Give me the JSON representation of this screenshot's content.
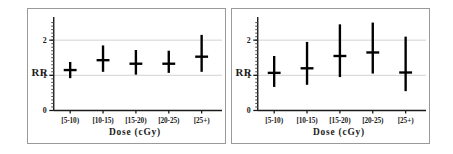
{
  "figure": {
    "background_color": "#ffffff",
    "panel_border_color": "#9a9a9a",
    "marker_color": "#000000",
    "grid_color": "#d2d2d2"
  },
  "chart_data": [
    {
      "type": "scatter",
      "panel": "left",
      "title": "",
      "xlabel": "Dose (cGy)",
      "ylabel": "RR",
      "categories": [
        "[5-10)",
        "[10-15)",
        "[15-20)",
        "[20-25)",
        "[25+)"
      ],
      "values": [
        1.15,
        1.43,
        1.33,
        1.33,
        1.53
      ],
      "ci_lower": [
        0.92,
        1.1,
        1.02,
        1.07,
        1.1
      ],
      "ci_upper": [
        1.38,
        1.85,
        1.72,
        1.7,
        2.15
      ],
      "yticks": [
        "0",
        "1",
        "2"
      ],
      "ytickvalues": [
        0,
        1,
        2
      ],
      "ylim": [
        0,
        2.55
      ],
      "grid": "horizontal at y=1 and y=2",
      "legend": "none",
      "minor_ticks": true
    },
    {
      "type": "scatter",
      "panel": "right",
      "title": "",
      "xlabel": "Dose (cGy)",
      "ylabel": "RR",
      "categories": [
        "[5-10)",
        "[10-15)",
        "[15-20)",
        "[20-25)",
        "[25+)"
      ],
      "values": [
        1.07,
        1.2,
        1.55,
        1.65,
        1.08
      ],
      "ci_lower": [
        0.67,
        0.73,
        0.95,
        1.05,
        0.55
      ],
      "ci_upper": [
        1.55,
        1.95,
        2.45,
        2.5,
        2.1
      ],
      "yticks": [
        "0",
        "1",
        "2"
      ],
      "ytickvalues": [
        0,
        1,
        2
      ],
      "ylim": [
        0,
        2.55
      ],
      "grid": "horizontal at y=1 and y=2",
      "legend": "none",
      "minor_ticks": true
    }
  ]
}
